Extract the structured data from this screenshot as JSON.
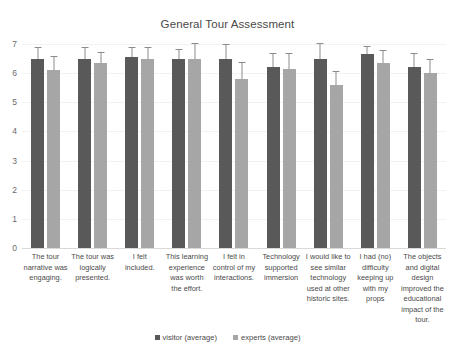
{
  "chart_data": {
    "type": "bar",
    "title": "General Tour Assessment",
    "xlabel": "",
    "ylabel": "",
    "ylim": [
      0,
      7
    ],
    "ytick_step": 1,
    "grid": true,
    "legend_position": "bottom",
    "yticks": [
      "7",
      "6",
      "5",
      "4",
      "3",
      "2",
      "1",
      "0"
    ],
    "categories": [
      "The tour narrative was engaging.",
      "The tour was logically presented.",
      "I felt included.",
      "This learning experience was worth the effort.",
      "I felt in control of my interactions.",
      "Technology supported immersion",
      "I would like to see similar technology used at other historic sites.",
      "I had (no) difficulty keeping up with my props",
      "The objects and digital design improved the educational impact of the tour."
    ],
    "series": [
      {
        "name": "visitor (average)",
        "color": "#595959",
        "values": [
          6.5,
          6.5,
          6.55,
          6.5,
          6.5,
          6.2,
          6.5,
          6.65,
          6.2
        ],
        "errors": [
          0.35,
          0.35,
          0.3,
          0.3,
          0.45,
          0.45,
          0.5,
          0.25,
          0.45
        ]
      },
      {
        "name": "experts (average)",
        "color": "#a6a6a6",
        "values": [
          6.1,
          6.35,
          6.5,
          6.5,
          5.8,
          6.15,
          5.6,
          6.35,
          6.0
        ],
        "errors": [
          0.45,
          0.35,
          0.35,
          0.5,
          0.55,
          0.5,
          0.45,
          0.4,
          0.45
        ]
      }
    ]
  }
}
